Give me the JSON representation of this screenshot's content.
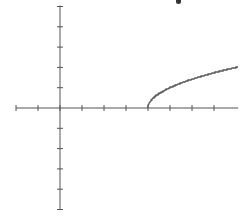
{
  "chart_data": {
    "type": "line",
    "title": "",
    "xlabel": "",
    "ylabel": "",
    "function": "y = sqrt(x - 4)",
    "xlim": [
      -2,
      8.1
    ],
    "ylim": [
      -5,
      5
    ],
    "x_ticks": [
      -2,
      -1,
      0,
      1,
      2,
      3,
      4,
      5,
      6,
      7
    ],
    "y_ticks": [
      -5,
      -4,
      -3,
      -2,
      -1,
      1,
      2,
      3,
      4,
      5
    ],
    "grid": false,
    "legend": null,
    "series": [
      {
        "name": "y = sqrt(x - 4)",
        "x": [
          4,
          4.25,
          4.5,
          5,
          5.5,
          6,
          6.5,
          7,
          7.5,
          8
        ],
        "values": [
          0,
          0.5,
          0.71,
          1,
          1.22,
          1.41,
          1.58,
          1.73,
          1.87,
          2
        ]
      }
    ],
    "colors": {
      "axis": "#555555",
      "curve": "#555555",
      "background": "#ffffff"
    }
  }
}
